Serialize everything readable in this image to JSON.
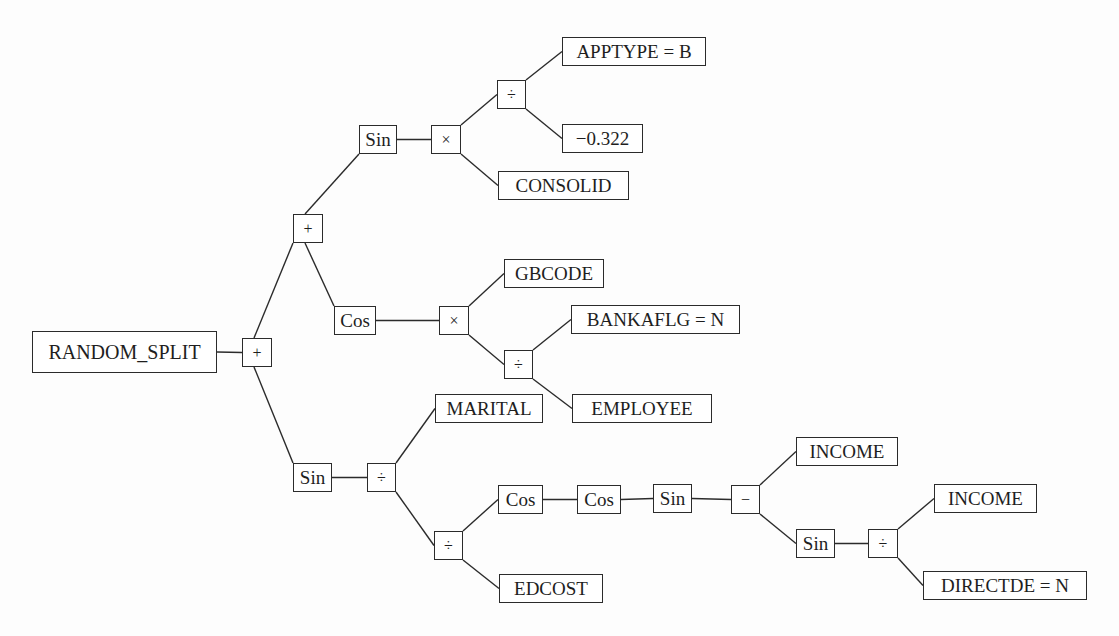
{
  "diagram": {
    "type": "expression-tree",
    "nodes": [
      {
        "id": "root_split",
        "label": "RANDOM_SPLIT",
        "kind": "root"
      },
      {
        "id": "plus_root",
        "label": "+",
        "kind": "operator"
      },
      {
        "id": "plus_upper",
        "label": "+",
        "kind": "operator"
      },
      {
        "id": "sin_upper",
        "label": "Sin",
        "kind": "function"
      },
      {
        "id": "times_upper",
        "label": "×",
        "kind": "operator"
      },
      {
        "id": "div_upper",
        "label": "÷",
        "kind": "operator"
      },
      {
        "id": "apptype",
        "label": "APPTYPE = B",
        "kind": "terminal"
      },
      {
        "id": "const_neg",
        "label": "−0.322",
        "kind": "terminal"
      },
      {
        "id": "consolid",
        "label": "CONSOLID",
        "kind": "terminal"
      },
      {
        "id": "cos_mid",
        "label": "Cos",
        "kind": "function"
      },
      {
        "id": "times_mid",
        "label": "×",
        "kind": "operator"
      },
      {
        "id": "gbcode",
        "label": "GBCODE",
        "kind": "terminal"
      },
      {
        "id": "div_mid",
        "label": "÷",
        "kind": "operator"
      },
      {
        "id": "bankaflg",
        "label": "BANKAFLG = N",
        "kind": "terminal"
      },
      {
        "id": "employee",
        "label": "EMPLOYEE",
        "kind": "terminal"
      },
      {
        "id": "sin_lower",
        "label": "Sin",
        "kind": "function"
      },
      {
        "id": "div_lower",
        "label": "÷",
        "kind": "operator"
      },
      {
        "id": "marital",
        "label": "MARITAL",
        "kind": "terminal"
      },
      {
        "id": "div_lower2",
        "label": "÷",
        "kind": "operator"
      },
      {
        "id": "edcost",
        "label": "EDCOST",
        "kind": "terminal"
      },
      {
        "id": "cos_a",
        "label": "Cos",
        "kind": "function"
      },
      {
        "id": "cos_b",
        "label": "Cos",
        "kind": "function"
      },
      {
        "id": "sin_c",
        "label": "Sin",
        "kind": "function"
      },
      {
        "id": "minus",
        "label": "−",
        "kind": "operator"
      },
      {
        "id": "income1",
        "label": "INCOME",
        "kind": "terminal"
      },
      {
        "id": "sin_d",
        "label": "Sin",
        "kind": "function"
      },
      {
        "id": "div_d",
        "label": "÷",
        "kind": "operator"
      },
      {
        "id": "income2",
        "label": "INCOME",
        "kind": "terminal"
      },
      {
        "id": "directde",
        "label": "DIRECTDE = N",
        "kind": "terminal"
      }
    ],
    "edges": [
      [
        "root_split",
        "plus_root"
      ],
      [
        "plus_root",
        "plus_upper"
      ],
      [
        "plus_root",
        "sin_lower"
      ],
      [
        "plus_upper",
        "sin_upper"
      ],
      [
        "plus_upper",
        "cos_mid"
      ],
      [
        "sin_upper",
        "times_upper"
      ],
      [
        "times_upper",
        "div_upper"
      ],
      [
        "times_upper",
        "consolid"
      ],
      [
        "div_upper",
        "apptype"
      ],
      [
        "div_upper",
        "const_neg"
      ],
      [
        "cos_mid",
        "times_mid"
      ],
      [
        "times_mid",
        "gbcode"
      ],
      [
        "times_mid",
        "div_mid"
      ],
      [
        "div_mid",
        "bankaflg"
      ],
      [
        "div_mid",
        "employee"
      ],
      [
        "sin_lower",
        "div_lower"
      ],
      [
        "div_lower",
        "marital"
      ],
      [
        "div_lower",
        "div_lower2"
      ],
      [
        "div_lower2",
        "cos_a"
      ],
      [
        "div_lower2",
        "edcost"
      ],
      [
        "cos_a",
        "cos_b"
      ],
      [
        "cos_b",
        "sin_c"
      ],
      [
        "sin_c",
        "minus"
      ],
      [
        "minus",
        "income1"
      ],
      [
        "minus",
        "sin_d"
      ],
      [
        "sin_d",
        "div_d"
      ],
      [
        "div_d",
        "income2"
      ],
      [
        "div_d",
        "directde"
      ]
    ]
  }
}
